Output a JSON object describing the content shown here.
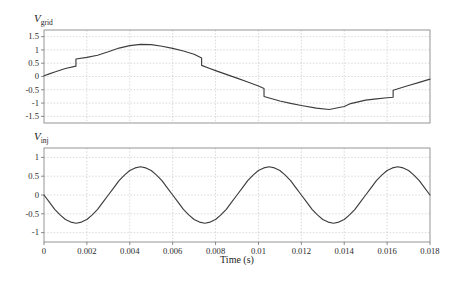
{
  "figure": {
    "background": "#ffffff",
    "colors": {
      "curve": "#3d3d3d",
      "grid": "#c3c3c3",
      "box": "#8a8a8a",
      "tick": "#6f6f6f",
      "text": "#2a2a2a"
    }
  },
  "chart_data": [
    {
      "id": "v_grid",
      "type": "line",
      "label": {
        "base": "V",
        "sub": "grid"
      },
      "xlim": [
        0,
        0.018
      ],
      "ylim": [
        -1.75,
        1.75
      ],
      "ytick_values": [
        1.5,
        1,
        0.5,
        0,
        -0.5,
        -1,
        -1.5
      ],
      "ytick_labels": [
        "1.5",
        "1",
        "0.5",
        "0",
        "-0.5",
        "-1",
        "-1.5"
      ],
      "xgrid_values": [
        0.002,
        0.004,
        0.006,
        0.008,
        0.01,
        0.012,
        0.014,
        0.016
      ],
      "xtick_values": [],
      "xtick_labels": [],
      "xlabel": "",
      "grid": true,
      "points": [
        [
          0,
          0.03
        ],
        [
          0.00025,
          0.1
        ],
        [
          0.0005,
          0.17
        ],
        [
          0.001,
          0.3
        ],
        [
          0.00149,
          0.39
        ],
        [
          0.00149,
          0.66
        ],
        [
          0.002,
          0.72
        ],
        [
          0.0025,
          0.8
        ],
        [
          0.003,
          0.93
        ],
        [
          0.0035,
          1.07
        ],
        [
          0.004,
          1.16
        ],
        [
          0.0045,
          1.21
        ],
        [
          0.005,
          1.2
        ],
        [
          0.0055,
          1.14
        ],
        [
          0.006,
          1.06
        ],
        [
          0.0065,
          0.96
        ],
        [
          0.007,
          0.84
        ],
        [
          0.00735,
          0.7
        ],
        [
          0.00735,
          0.42
        ],
        [
          0.0077,
          0.31
        ],
        [
          0.008,
          0.22
        ],
        [
          0.0085,
          0.08
        ],
        [
          0.009,
          -0.06
        ],
        [
          0.0095,
          -0.21
        ],
        [
          0.01,
          -0.36
        ],
        [
          0.01026,
          -0.45
        ],
        [
          0.01026,
          -0.75
        ],
        [
          0.011,
          -0.92
        ],
        [
          0.0115,
          -1.01
        ],
        [
          0.012,
          -1.09
        ],
        [
          0.0127,
          -1.19
        ],
        [
          0.0133,
          -1.24
        ],
        [
          0.014,
          -1.13
        ],
        [
          0.0143,
          -1.02
        ],
        [
          0.015,
          -0.89
        ],
        [
          0.0155,
          -0.84
        ],
        [
          0.016,
          -0.8
        ],
        [
          0.01628,
          -0.78
        ],
        [
          0.01628,
          -0.52
        ],
        [
          0.017,
          -0.34
        ],
        [
          0.0175,
          -0.22
        ],
        [
          0.018,
          -0.1
        ]
      ]
    },
    {
      "id": "v_inj",
      "type": "line",
      "label": {
        "base": "V",
        "sub": "inj"
      },
      "xlim": [
        0,
        0.018
      ],
      "ylim": [
        -1.25,
        1.25
      ],
      "ytick_values": [
        1,
        0.5,
        0,
        -0.5,
        -1
      ],
      "ytick_labels": [
        "1",
        "0.5",
        "0",
        "-0.5",
        "-1"
      ],
      "xgrid_values": [
        0.002,
        0.004,
        0.006,
        0.008,
        0.01,
        0.012,
        0.014,
        0.016
      ],
      "xtick_values": [
        0,
        0.002,
        0.004,
        0.006,
        0.008,
        0.01,
        0.012,
        0.014,
        0.016,
        0.018
      ],
      "xtick_labels": [
        "0",
        "0.002",
        "0.004",
        "0.006",
        "0.008",
        "0.01",
        "0.012",
        "0.014",
        "0.016",
        "0.018"
      ],
      "xlabel": "Time (s)",
      "grid": true,
      "amplitude": 0.75,
      "period_s": 0.006,
      "series_uniform": {
        "t0": 0,
        "dt": 0.00025,
        "values": [
          0,
          -0.19,
          -0.38,
          -0.53,
          -0.65,
          -0.72,
          -0.75,
          -0.72,
          -0.65,
          -0.53,
          -0.38,
          -0.19,
          0,
          0.19,
          0.38,
          0.53,
          0.65,
          0.72,
          0.75,
          0.72,
          0.65,
          0.53,
          0.38,
          0.19,
          0,
          -0.19,
          -0.38,
          -0.53,
          -0.65,
          -0.72,
          -0.75,
          -0.72,
          -0.65,
          -0.53,
          -0.38,
          -0.19,
          0,
          0.19,
          0.38,
          0.53,
          0.65,
          0.72,
          0.75,
          0.72,
          0.65,
          0.53,
          0.38,
          0.19,
          0,
          -0.19,
          -0.38,
          -0.53,
          -0.65,
          -0.72,
          -0.75,
          -0.72,
          -0.65,
          -0.53,
          -0.38,
          -0.19,
          0,
          0.19,
          0.38,
          0.53,
          0.65,
          0.72,
          0.75,
          0.72,
          0.65,
          0.53,
          0.38,
          0.19,
          0
        ]
      }
    }
  ]
}
